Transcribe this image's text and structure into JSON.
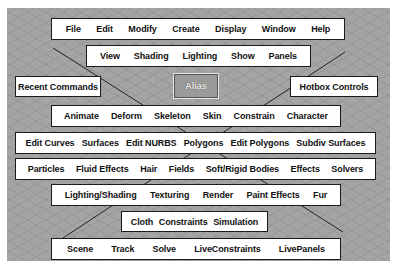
{
  "hotbox": {
    "rows": [
      {
        "id": "main-menus",
        "items": [
          "File",
          "Edit",
          "Modify",
          "Create",
          "Display",
          "Window",
          "Help"
        ]
      },
      {
        "id": "view-menus",
        "items": [
          "View",
          "Shading",
          "Lighting",
          "Show",
          "Panels"
        ]
      },
      {
        "id": "animation-menus",
        "items": [
          "Animate",
          "Deform",
          "Skeleton",
          "Skin",
          "Constrain",
          "Character"
        ]
      },
      {
        "id": "modeling-menus",
        "items": [
          "Edit Curves",
          "Surfaces",
          "Edit NURBS",
          "Polygons",
          "Edit Polygons",
          "Subdiv Surfaces"
        ]
      },
      {
        "id": "dynamics-menus",
        "items": [
          "Particles",
          "Fluid Effects",
          "Hair",
          "Fields",
          "Soft/Rigid Bodies",
          "Effects",
          "Solvers"
        ]
      },
      {
        "id": "rendering-menus",
        "items": [
          "Lighting/Shading",
          "Texturing",
          "Render",
          "Paint Effects",
          "Fur"
        ]
      },
      {
        "id": "cloth-menus",
        "items": [
          "Cloth",
          "Constraints",
          "Simulation"
        ]
      },
      {
        "id": "live-menus",
        "items": [
          "Scene",
          "Track",
          "Solve",
          "LiveConstraints",
          "LivePanels"
        ]
      }
    ],
    "recent_commands": "Recent Commands",
    "hotbox_controls": "Hotbox Controls",
    "center_label": "Alias"
  }
}
